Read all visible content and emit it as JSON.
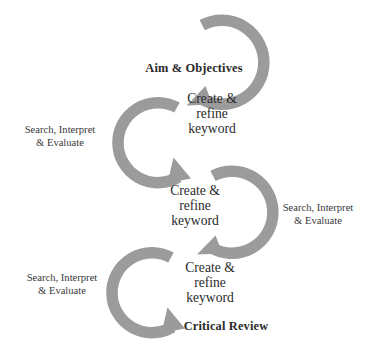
{
  "diagram": {
    "canvas": {
      "width": 375,
      "height": 356
    },
    "colors": {
      "arrow_gray": "#9b9b9b",
      "text_dark": "#2a2a2a",
      "text_process": "#3a3a3a",
      "background": "#ffffff"
    },
    "nodes": [
      {
        "id": "aim-objectives",
        "label": "Aim & Objectives",
        "emphasis": "bold",
        "x": 194,
        "y": 62
      },
      {
        "id": "keyword-1",
        "label": "Create &\nrefine\nkeyword",
        "emphasis": "normal",
        "x": 172,
        "y": 93
      },
      {
        "id": "keyword-2",
        "label": "Create &\nrefine\nkeyword",
        "emphasis": "normal",
        "x": 155,
        "y": 185
      },
      {
        "id": "keyword-3",
        "label": "Create &\nrefine\nkeyword",
        "emphasis": "normal",
        "x": 170,
        "y": 262
      },
      {
        "id": "critical-review",
        "label": "Critical Review",
        "emphasis": "bold",
        "x": 172,
        "y": 322
      }
    ],
    "process_labels": [
      {
        "id": "search-interpret-evaluate-1",
        "label": "Search, Interpret\n& Evaluate",
        "x": 11,
        "y": 124
      },
      {
        "id": "search-interpret-evaluate-2",
        "label": "Search, Interpret\n& Evaluate",
        "x": 268,
        "y": 202
      },
      {
        "id": "search-interpret-evaluate-3",
        "label": "Search, Interpret\n& Evaluate",
        "x": 13,
        "y": 272
      }
    ],
    "arrows": [
      {
        "id": "arrow-cycle-1",
        "orientation": "opens-left",
        "center_x": 222,
        "center_y": 62,
        "radius": 42,
        "thickness": 11,
        "start_angle_deg": -118,
        "end_angle_deg": 118,
        "direction": "clockwise",
        "arrowhead": "down-left"
      },
      {
        "id": "arrow-cycle-2",
        "orientation": "opens-right",
        "center_x": 158,
        "center_y": 142,
        "radius": 40,
        "thickness": 11,
        "start_angle_deg": -62,
        "end_angle_deg": 62,
        "direction": "counter-clockwise",
        "arrowhead": "down-right"
      },
      {
        "id": "arrow-cycle-3",
        "orientation": "opens-left",
        "center_x": 232,
        "center_y": 212,
        "radius": 41,
        "thickness": 11,
        "start_angle_deg": -118,
        "end_angle_deg": 118,
        "direction": "clockwise",
        "arrowhead": "down-left"
      },
      {
        "id": "arrow-cycle-4",
        "orientation": "opens-right",
        "center_x": 152,
        "center_y": 292,
        "radius": 40,
        "thickness": 11,
        "start_angle_deg": -62,
        "end_angle_deg": 62,
        "direction": "counter-clockwise",
        "arrowhead": "down-right"
      }
    ]
  }
}
